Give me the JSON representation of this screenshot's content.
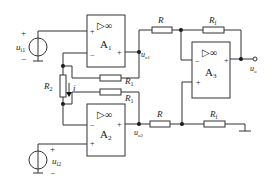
{
  "diagram": {
    "type": "circuit",
    "opamps": [
      {
        "id": "A1",
        "label": "A",
        "sub": "1",
        "symbol": "▷∞",
        "plus": "+",
        "minus": "−",
        "out": "+"
      },
      {
        "id": "A2",
        "label": "A",
        "sub": "2",
        "symbol": "▷∞",
        "plus": "+",
        "minus": "−",
        "out": "+"
      },
      {
        "id": "A3",
        "label": "A",
        "sub": "3",
        "symbol": "▷∞",
        "plus": "+",
        "minus": "−",
        "out": "+"
      }
    ],
    "sources": [
      {
        "id": "ui1",
        "label": "u",
        "sub": "i1",
        "plus": "+",
        "minus": "−"
      },
      {
        "id": "ui2",
        "label": "u",
        "sub": "i2",
        "plus": "+",
        "minus": "−"
      }
    ],
    "resistors": {
      "R1_top": {
        "label": "R",
        "sub": "1"
      },
      "R1_bot": {
        "label": "R",
        "sub": "1"
      },
      "R2": {
        "label": "R",
        "sub": "2"
      },
      "R_top": {
        "label": "R",
        "sub": ""
      },
      "R_bot": {
        "label": "R",
        "sub": ""
      },
      "Rf_top": {
        "label": "R",
        "sub": "f"
      },
      "Rf_bot": {
        "label": "R",
        "sub": "f"
      }
    },
    "nodes": {
      "uo1": {
        "label": "u",
        "sub": "o1"
      },
      "uo2": {
        "label": "u",
        "sub": "o2"
      },
      "uo": {
        "label": "u",
        "sub": "o"
      }
    },
    "current": {
      "label": "i"
    }
  }
}
